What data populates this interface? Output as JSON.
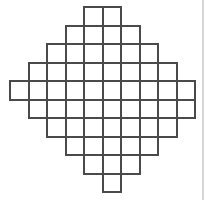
{
  "diagram": {
    "type": "grid-polyomino",
    "shape": "diamond",
    "cell_size_px": 18.5,
    "origin_px": [
      9,
      6
    ],
    "line_color": "#4a4a4a",
    "background_color": "#ffffff",
    "edge_line_color": "#d6d6d6",
    "columns": 10,
    "rows": 10,
    "row_spans": [
      {
        "row": 0,
        "col_start": 4,
        "col_end": 5
      },
      {
        "row": 1,
        "col_start": 3,
        "col_end": 6
      },
      {
        "row": 2,
        "col_start": 2,
        "col_end": 7
      },
      {
        "row": 3,
        "col_start": 1,
        "col_end": 8
      },
      {
        "row": 4,
        "col_start": 0,
        "col_end": 9
      },
      {
        "row": 5,
        "col_start": 1,
        "col_end": 9
      },
      {
        "row": 6,
        "col_start": 2,
        "col_end": 8
      },
      {
        "row": 7,
        "col_start": 3,
        "col_end": 7
      },
      {
        "row": 8,
        "col_start": 4,
        "col_end": 6
      },
      {
        "row": 9,
        "col_start": 5,
        "col_end": 5
      }
    ],
    "total_cells": 59
  }
}
